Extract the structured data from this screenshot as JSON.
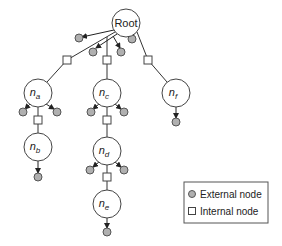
{
  "diagram": {
    "type": "tree",
    "nodes": [
      {
        "id": "root",
        "label": "Root",
        "sub": ""
      },
      {
        "id": "na",
        "label": "n",
        "sub": "a"
      },
      {
        "id": "nb",
        "label": "n",
        "sub": "b"
      },
      {
        "id": "nc",
        "label": "n",
        "sub": "c"
      },
      {
        "id": "nd",
        "label": "n",
        "sub": "d"
      },
      {
        "id": "ne",
        "label": "n",
        "sub": "e"
      },
      {
        "id": "nf",
        "label": "n",
        "sub": "f"
      }
    ],
    "edges": [
      {
        "from": "root",
        "to": "na",
        "via": "internal"
      },
      {
        "from": "root",
        "to": "nc",
        "via": "internal"
      },
      {
        "from": "root",
        "to": "nf",
        "via": "internal"
      },
      {
        "from": "na",
        "to": "nb",
        "via": "internal"
      },
      {
        "from": "nc",
        "to": "nd",
        "via": "internal"
      },
      {
        "from": "nd",
        "to": "ne",
        "via": "internal"
      }
    ],
    "external_counts": {
      "root": 4,
      "na": 2,
      "nb": 1,
      "nc": 2,
      "nd": 2,
      "ne": 1,
      "nf": 1
    }
  },
  "legend": {
    "external": "External node",
    "internal": "Internal node"
  },
  "colors": {
    "external_fill": "#b0b0b0",
    "line": "#333333"
  }
}
